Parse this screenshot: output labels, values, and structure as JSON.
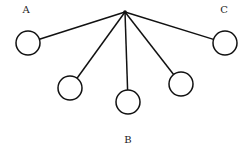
{
  "diagram": {
    "type": "pendulum-fan",
    "pivot": {
      "x": 125,
      "y": 12
    },
    "labels": [
      {
        "text": "A",
        "x": 26,
        "y": 13
      },
      {
        "text": "C",
        "x": 224,
        "y": 13
      },
      {
        "text": "B",
        "x": 128,
        "y": 143
      }
    ],
    "bobs": [
      {
        "id": "bob-a",
        "cx": 28,
        "cy": 43,
        "r": 12
      },
      {
        "id": "bob-2",
        "cx": 70,
        "cy": 88,
        "r": 12
      },
      {
        "id": "bob-b",
        "cx": 128,
        "cy": 102,
        "r": 12
      },
      {
        "id": "bob-4",
        "cx": 181,
        "cy": 84,
        "r": 12
      },
      {
        "id": "bob-c",
        "cx": 225,
        "cy": 43,
        "r": 12
      }
    ],
    "colors": {
      "line": "#111111",
      "background": "#ffffff"
    }
  }
}
